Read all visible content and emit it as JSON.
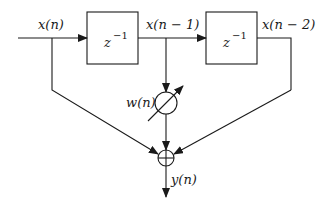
{
  "diagram": {
    "type": "FIR filter block diagram (2 delay taps)",
    "signals": {
      "input": "x(n)",
      "delay1_out": "x(n − 1)",
      "delay2_out": "x(n − 2)",
      "weight": "w(n)",
      "output": "y(n)"
    },
    "blocks": [
      {
        "id": "delay-1",
        "label_base": "z",
        "label_exp": "−1"
      },
      {
        "id": "delay-2",
        "label_base": "z",
        "label_exp": "−1"
      }
    ],
    "nodes": [
      {
        "id": "adjustable-weight",
        "symbol": "circle with diagonal arrow"
      },
      {
        "id": "summer",
        "symbol": "circle with plus"
      }
    ],
    "colors": {
      "stroke": "#1a1a1a",
      "background": "#ffffff"
    }
  }
}
